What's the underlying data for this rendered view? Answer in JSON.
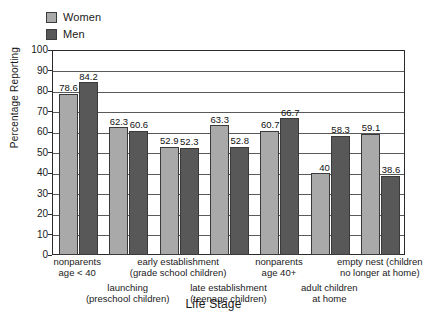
{
  "legend": {
    "position": "top-left",
    "entries": [
      {
        "label": "Women",
        "color": "#a9a9a9",
        "icon": "legend-swatch-women"
      },
      {
        "label": "Men",
        "color": "#585858",
        "icon": "legend-swatch-men"
      }
    ]
  },
  "axes": {
    "ylabel": "Percentage Reporting",
    "xlabel": "Life Stage",
    "yticks": [
      "0",
      "10",
      "20",
      "30",
      "40",
      "50",
      "60",
      "70",
      "80",
      "90",
      "100"
    ]
  },
  "chart_data": {
    "type": "bar",
    "title": "",
    "subtitle": "",
    "xlabel": "Life Stage",
    "ylabel": "Percentage Reporting",
    "ylim": [
      0,
      100
    ],
    "ytick_step": 10,
    "grid": true,
    "legend_position": "top-left",
    "categories": [
      "nonparents age < 40",
      "launching (preschool children)",
      "early establishment (grade school children)",
      "late establishment (teenage children)",
      "nonparents age 40+",
      "adult children at home",
      "empty nest (children no longer at home)"
    ],
    "category_lines": [
      [
        "nonparents",
        "age < 40"
      ],
      [
        "launching",
        "(preschool children)"
      ],
      [
        "early establishment",
        "(grade school children)"
      ],
      [
        "late establishment",
        "(teenage children)"
      ],
      [
        "nonparents",
        "age 40+"
      ],
      [
        "adult children",
        "at home"
      ],
      [
        "empty nest (children",
        "no longer at home)"
      ]
    ],
    "series": [
      {
        "name": "Women",
        "color": "#a9a9a9",
        "values": [
          78.6,
          62.3,
          52.9,
          63.3,
          60.7,
          40,
          59.1
        ],
        "labels": [
          "78.6",
          "62.3",
          "52.9",
          "63.3",
          "60.7",
          "40",
          "59.1"
        ]
      },
      {
        "name": "Men",
        "color": "#585858",
        "values": [
          84.2,
          60.6,
          52.3,
          52.8,
          66.7,
          58.3,
          38.6
        ],
        "labels": [
          "84.2",
          "60.6",
          "52.3",
          "52.8",
          "66.7",
          "58.3",
          "38.6"
        ]
      }
    ]
  }
}
